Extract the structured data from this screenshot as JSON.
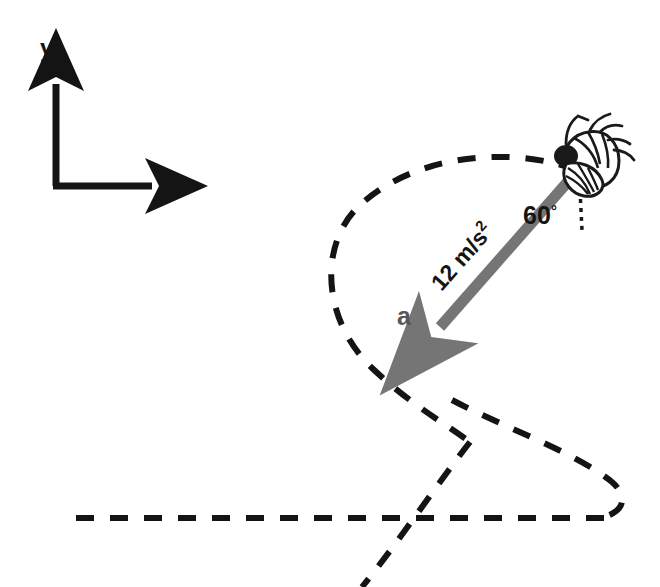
{
  "figure": {
    "type": "physics-vector-diagram",
    "background_color": "#ffffff",
    "width": 660,
    "height": 587
  },
  "axes": {
    "x_label": "x",
    "y_label": "y",
    "color": "#141414",
    "origin": {
      "x": 56,
      "y": 186
    },
    "x_tip": {
      "x": 160,
      "y": 186
    },
    "y_tip": {
      "x": 56,
      "y": 76
    }
  },
  "vector": {
    "label": "a",
    "magnitude_text": "12 m/s",
    "magnitude_exponent": "2",
    "magnitude_value": 12,
    "magnitude_units": "m/s²",
    "color": "#757575",
    "tail": {
      "x": 572,
      "y": 177
    },
    "tip": {
      "x": 428,
      "y": 340
    },
    "label_position": {
      "x": 404,
      "y": 325
    }
  },
  "angle": {
    "label": "60",
    "degree_symbol": "°",
    "value": 60,
    "units": "degrees",
    "measured_from": "vertical-dotted-reference-line",
    "label_position": {
      "x": 540,
      "y": 224
    },
    "color": "#141414"
  },
  "reference_line": {
    "name": "vertical-dotted-reference",
    "color": "#1a1a1a",
    "from": {
      "x": 580,
      "y": 188
    },
    "to": {
      "x": 582,
      "y": 230
    }
  },
  "trajectory": {
    "name": "dashed-flight-path",
    "style": "dashed",
    "color": "#141414",
    "stroke_width": 6,
    "dash_pattern": "18 16",
    "description": "looping flight path crossing itself with a long horizontal tail to the left"
  },
  "fly": {
    "name": "fly-insect",
    "head_color": "#1a1a1a",
    "body_outline_color": "#1a1a1a",
    "wing_color": "#262626",
    "position": {
      "x": 582,
      "y": 158
    }
  }
}
